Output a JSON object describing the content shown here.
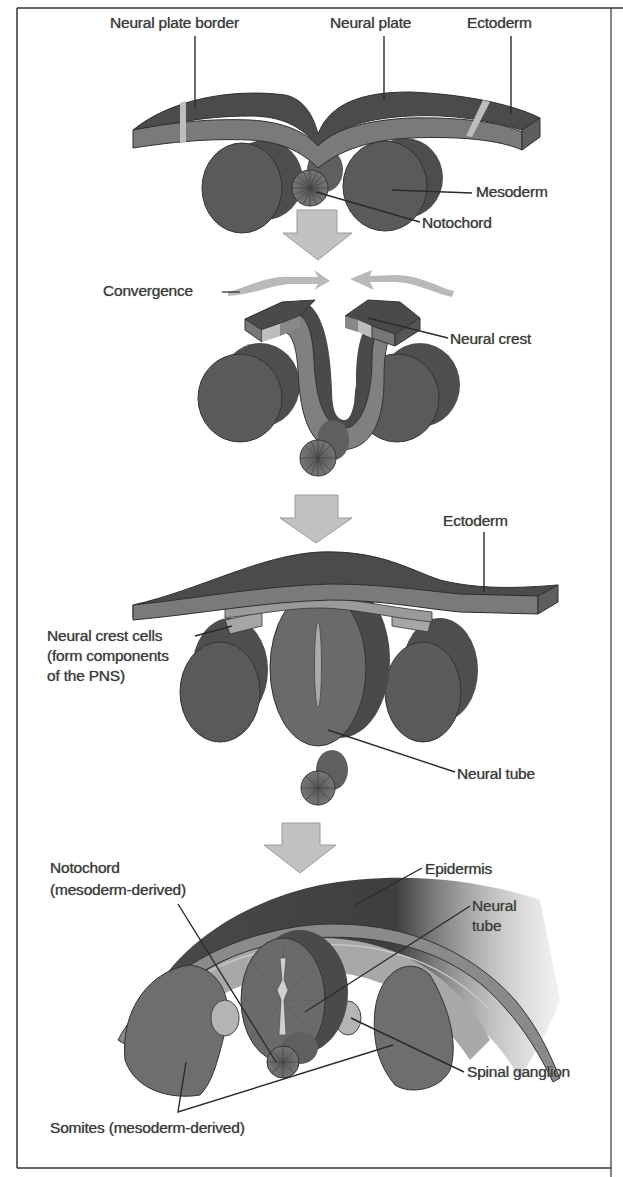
{
  "figure": {
    "colors": {
      "dark_tissue": "#4a4a4a",
      "mid_tissue": "#7a7a7a",
      "light_tissue": "#a8a8a8",
      "arrow": "#bdbdbd",
      "label_text": "#3a3a3a",
      "border": "#333333"
    },
    "stages": [
      {
        "id": "stage-1",
        "labels": [
          {
            "name": "label-neural-plate-border",
            "text": "Neural plate border",
            "x": 110,
            "y": 13
          },
          {
            "name": "label-neural-plate",
            "text": "Neural plate",
            "x": 330,
            "y": 13
          },
          {
            "name": "label-ectoderm",
            "text": "Ectoderm",
            "x": 467,
            "y": 13
          },
          {
            "name": "label-mesoderm",
            "text": "Mesoderm",
            "x": 476,
            "y": 182
          },
          {
            "name": "label-notochord",
            "text": "Notochord",
            "x": 422,
            "y": 213
          }
        ]
      },
      {
        "id": "stage-2",
        "labels": [
          {
            "name": "label-convergence",
            "text": "Convergence",
            "x": 103,
            "y": 281
          },
          {
            "name": "label-neural-crest",
            "text": "Neural crest",
            "x": 450,
            "y": 329
          }
        ]
      },
      {
        "id": "stage-3",
        "labels": [
          {
            "name": "label-ectoderm-2",
            "text": "Ectoderm",
            "x": 443,
            "y": 511
          },
          {
            "name": "label-neural-crest-cells-1",
            "text": "Neural crest cells",
            "x": 47,
            "y": 626
          },
          {
            "name": "label-neural-crest-cells-2",
            "text": "(form components",
            "x": 47,
            "y": 646
          },
          {
            "name": "label-neural-crest-cells-3",
            "text": "of the PNS)",
            "x": 47,
            "y": 666
          },
          {
            "name": "label-neural-tube",
            "text": "Neural tube",
            "x": 457,
            "y": 764
          }
        ]
      },
      {
        "id": "stage-4",
        "labels": [
          {
            "name": "label-notochord-2-line1",
            "text": "Notochord",
            "x": 50,
            "y": 858
          },
          {
            "name": "label-notochord-2-line2",
            "text": "(mesoderm-derived)",
            "x": 50,
            "y": 880
          },
          {
            "name": "label-epidermis",
            "text": "Epidermis",
            "x": 425,
            "y": 859
          },
          {
            "name": "label-neural-tube-2-line1",
            "text": "Neural",
            "x": 472,
            "y": 896
          },
          {
            "name": "label-neural-tube-2-line2",
            "text": "tube",
            "x": 472,
            "y": 916
          },
          {
            "name": "label-spinal-ganglion",
            "text": "Spinal ganglion",
            "x": 467,
            "y": 1062
          },
          {
            "name": "label-somites",
            "text": "Somites (mesoderm-derived)",
            "x": 50,
            "y": 1118
          }
        ]
      }
    ]
  }
}
